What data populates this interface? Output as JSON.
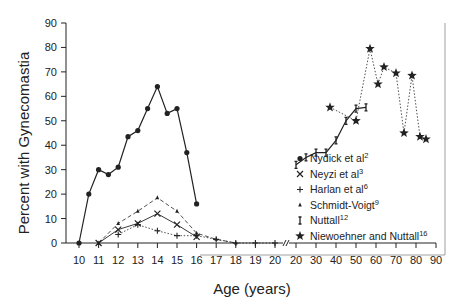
{
  "chart_data": {
    "type": "line",
    "title": "",
    "xlabel": "Age (years)",
    "ylabel": "Percent with Gynecomastia",
    "ylim": [
      0,
      90
    ],
    "yticks": [
      0,
      10,
      20,
      30,
      40,
      50,
      60,
      70,
      80,
      90
    ],
    "x_segments": [
      {
        "range": [
          10,
          20
        ],
        "ticks": [
          10,
          11,
          12,
          13,
          14,
          15,
          16,
          17,
          18,
          19,
          20
        ]
      },
      {
        "range": [
          20,
          90
        ],
        "ticks": [
          20,
          30,
          40,
          50,
          60,
          70,
          80,
          90
        ]
      }
    ],
    "axis_break": true,
    "grid": false,
    "legend_position": "right",
    "series": [
      {
        "name": "Nydick et al",
        "ref": "2",
        "marker": "dot",
        "line": "solid",
        "x": [
          10,
          10.5,
          11,
          11.5,
          12,
          12.5,
          13,
          13.5,
          14,
          14.5,
          15,
          15.5,
          16
        ],
        "y": [
          0,
          20,
          30,
          28,
          31,
          43.5,
          46,
          55,
          64,
          53,
          55,
          37,
          16
        ]
      },
      {
        "name": "Neyzi et al",
        "ref": "3",
        "marker": "x",
        "line": "solid-thin",
        "x": [
          11,
          12,
          13,
          14,
          15,
          16
        ],
        "y": [
          0,
          5.5,
          8,
          12,
          7.5,
          2.5
        ]
      },
      {
        "name": "Harlan et al",
        "ref": "6",
        "marker": "plus",
        "line": "dotted",
        "x": [
          12,
          13,
          14,
          15,
          16,
          17,
          18,
          19,
          20
        ],
        "y": [
          3.5,
          7.5,
          5,
          3,
          3,
          1.5,
          0,
          0,
          0
        ]
      },
      {
        "name": "Schmidt-Voigt",
        "ref": "9",
        "marker": "small-triangle",
        "line": "dashed",
        "x": [
          11,
          12,
          13,
          14,
          15,
          16,
          17,
          18
        ],
        "y": [
          0,
          8,
          13,
          18.5,
          13,
          4,
          1.5,
          0
        ]
      },
      {
        "name": "Nuttall",
        "ref": "12",
        "marker": "bar",
        "line": "solid",
        "x": [
          20,
          25,
          30,
          35,
          40,
          45,
          50,
          55
        ],
        "y": [
          32,
          35,
          37,
          37,
          42,
          50,
          55,
          55.5
        ]
      },
      {
        "name": "Niewoehner and Nuttall",
        "ref": "16",
        "marker": "star",
        "line": "dotted",
        "x": [
          37,
          50,
          57,
          61,
          64,
          70,
          74,
          78,
          82,
          85
        ],
        "y": [
          55.5,
          50,
          79.5,
          65,
          72,
          69.5,
          45,
          68.5,
          43.5,
          42.5
        ]
      }
    ]
  }
}
